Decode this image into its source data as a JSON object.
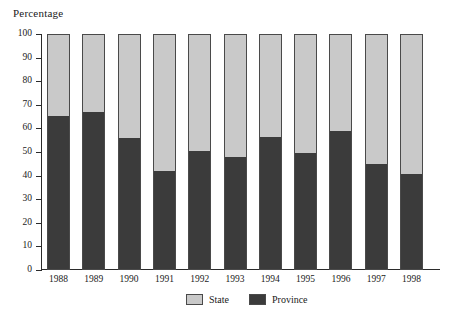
{
  "chart_data": {
    "type": "bar",
    "subtype": "stacked-100-percent",
    "title": "",
    "xlabel": "",
    "ylabel": "Percentage",
    "ylim": [
      0,
      100
    ],
    "yticks": [
      0,
      10,
      20,
      30,
      40,
      50,
      60,
      70,
      80,
      90,
      100
    ],
    "ytick_labels": [
      "0",
      "10",
      "20",
      "30",
      "40",
      "50",
      "60",
      "70",
      "80",
      "90",
      "100"
    ],
    "grid": false,
    "legend_position": "bottom-center",
    "categories": [
      "1988",
      "1989",
      "1990",
      "1991",
      "1992",
      "1993",
      "1994",
      "1995",
      "1996",
      "1997",
      "1998"
    ],
    "series": [
      {
        "name": "Province",
        "color": "#3b3b3b",
        "values": [
          65.5,
          67.0,
          56.0,
          42.0,
          50.5,
          48.0,
          56.5,
          49.5,
          59.0,
          45.0,
          40.5
        ]
      },
      {
        "name": "State",
        "color": "#c9c9c9",
        "values": [
          34.5,
          33.0,
          44.0,
          58.0,
          49.5,
          52.0,
          43.5,
          50.5,
          41.0,
          55.0,
          59.5
        ]
      }
    ]
  },
  "legend": {
    "items": [
      {
        "label": "State",
        "swatch": "state"
      },
      {
        "label": "Province",
        "swatch": "province"
      }
    ]
  },
  "colors": {
    "state": "#c9c9c9",
    "province": "#3b3b3b",
    "axis": "#2b2b2b",
    "bar_border": "#4a4a4a",
    "background": "#ffffff"
  }
}
